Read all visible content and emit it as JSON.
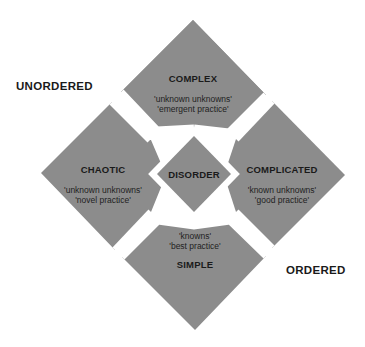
{
  "diagram": {
    "fill_color": "#8c8c8c",
    "background": "#ffffff",
    "regions": {
      "unordered": "UNORDERED",
      "ordered": "ORDERED"
    },
    "domains": {
      "complex": {
        "title": "COMPLEX",
        "line1": "'unknown unknowns'",
        "line2": "'emergent practice'"
      },
      "chaotic": {
        "title": "CHAOTIC",
        "line1": "'unknown unknowns'",
        "line2": "'novel practice'"
      },
      "complicated": {
        "title": "COMPLICATED",
        "line1": "'known unknowns'",
        "line2": "'good practice'"
      },
      "simple": {
        "title": "SIMPLE",
        "line1": "'knowns'",
        "line2": "'best practice'"
      },
      "disorder": {
        "title": "DISORDER"
      }
    }
  }
}
